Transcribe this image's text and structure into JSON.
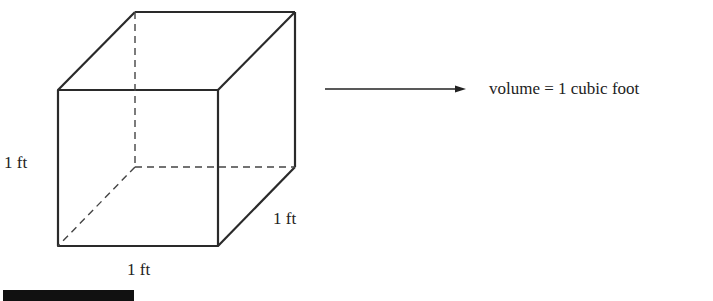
{
  "diagram": {
    "labels": {
      "height": "1 ft",
      "depth": "1 ft",
      "width": "1 ft"
    },
    "result_text": "volume = 1 cubic foot",
    "colors": {
      "line": "#2a2a2a",
      "background": "#ffffff"
    }
  }
}
